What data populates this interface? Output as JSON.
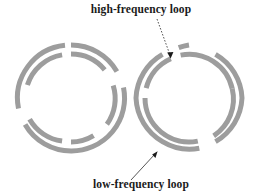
{
  "figure": {
    "type": "diagram",
    "background_color": "#ffffff",
    "ring_color": "#9d9d9d",
    "label_color": "#1a1a1a",
    "leader_color": "#2b2b2b",
    "canvas": {
      "width": 258,
      "height": 195
    },
    "labels": {
      "high_frequency": "high-frequency loop",
      "low_frequency": "low-frequency loop"
    },
    "loops": [
      {
        "name": "left-loop-assembly",
        "center": {
          "x": 71,
          "y": 98
        },
        "rings": [
          {
            "name": "low-frequency-loop",
            "radius": 53,
            "stroke_width": 5,
            "gaps_deg": [
              [
                82,
                96
              ],
              [
                262,
                276
              ]
            ]
          },
          {
            "name": "high-frequency-loop",
            "radius": 44,
            "stroke_width": 5,
            "gaps_deg": [
              [
                40,
                52
              ],
              [
                96,
                108
              ],
              [
                220,
                232
              ],
              [
                276,
                288
              ]
            ]
          }
        ]
      },
      {
        "name": "right-loop-assembly",
        "center": {
          "x": 189,
          "y": 98
        },
        "rings": [
          {
            "name": "low-frequency-loop",
            "radius": 53,
            "stroke_width": 5,
            "gaps_deg": [
              [
                60,
                76
              ],
              [
                240,
                256
              ]
            ]
          },
          {
            "name": "high-frequency-loop",
            "radius": 44,
            "stroke_width": 5,
            "gaps_deg": [
              [
                0,
                12
              ],
              [
                110,
                124
              ],
              [
                180,
                192
              ],
              [
                290,
                304
              ]
            ]
          }
        ]
      }
    ],
    "annotations": [
      {
        "name": "high-frequency-leader",
        "label_key": "high_frequency",
        "text_x": 141,
        "text_y": 13,
        "text_anchor": "middle",
        "line": {
          "x1": 158,
          "y1": 18,
          "x2": 171,
          "y2": 56
        },
        "dashed": true
      },
      {
        "name": "low-frequency-leader",
        "label_key": "low_frequency",
        "text_x": 141,
        "text_y": 188,
        "text_anchor": "middle",
        "line": {
          "x1": 133,
          "y1": 179,
          "x2": 156,
          "y2": 153
        },
        "dashed": false
      }
    ]
  }
}
